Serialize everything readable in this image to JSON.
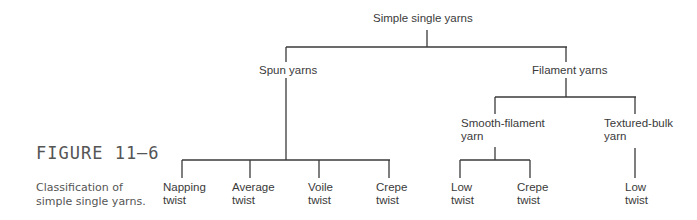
{
  "figure": {
    "label": "FIGURE 11–6",
    "caption": "Classification of simple single yarns."
  },
  "tree": {
    "root": "Simple single yarns",
    "spun": {
      "label": "Spun yarns",
      "children": [
        {
          "line1": "Napping",
          "line2": "twist"
        },
        {
          "line1": "Average",
          "line2": "twist"
        },
        {
          "line1": "Voile",
          "line2": "twist"
        },
        {
          "line1": "Crepe",
          "line2": "twist"
        }
      ]
    },
    "filament": {
      "label": "Filament yarns",
      "smooth": {
        "line1": "Smooth-filament",
        "line2": "yarn",
        "children": [
          {
            "line1": "Low",
            "line2": "twist"
          },
          {
            "line1": "Crepe",
            "line2": "twist"
          }
        ]
      },
      "textured": {
        "line1": "Textured-bulk",
        "line2": "yarn",
        "children": [
          {
            "line1": "Low",
            "line2": "twist"
          }
        ]
      }
    }
  },
  "colors": {
    "line": "#3a3a3a",
    "text": "#3a3a3a"
  }
}
